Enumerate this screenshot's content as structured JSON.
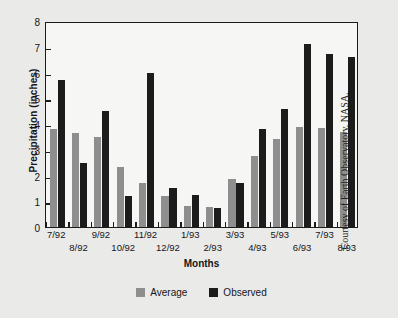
{
  "chart_data": {
    "type": "bar",
    "title": "",
    "xlabel": "Months",
    "ylabel": "Precipitation (inches)",
    "ylim": [
      0,
      8
    ],
    "yticks": [
      0,
      1,
      2,
      3,
      4,
      5,
      6,
      7,
      8
    ],
    "grid": false,
    "legend_position": "bottom-center",
    "categories": [
      "7/92",
      "8/92",
      "9/92",
      "10/92",
      "11/92",
      "12/92",
      "1/93",
      "2/93",
      "3/93",
      "4/93",
      "5/93",
      "6/93",
      "7/93",
      "8/93"
    ],
    "series": [
      {
        "name": "Average",
        "color": "#8e8e8e",
        "values": [
          3.8,
          3.65,
          3.5,
          2.35,
          1.7,
          1.2,
          0.8,
          0.78,
          1.85,
          2.75,
          3.4,
          3.9,
          3.85,
          3.7
        ]
      },
      {
        "name": "Observed",
        "color": "#1c1c1c",
        "values": [
          5.7,
          2.5,
          4.5,
          1.2,
          6.0,
          1.5,
          1.25,
          0.72,
          1.7,
          3.8,
          4.6,
          7.1,
          6.7,
          6.6
        ]
      }
    ]
  },
  "axes": {
    "y_title": "Precipitation (inches)",
    "x_title": "Months"
  },
  "legend": {
    "entries": [
      {
        "label": "Average",
        "color": "#8e8e8e"
      },
      {
        "label": "Observed",
        "color": "#1c1c1c"
      }
    ]
  },
  "credit": {
    "text": "Courtesy of Earth Observatory, NASA."
  },
  "colors": {
    "average_bar": "#8e8e8e",
    "observed_bar": "#1c1c1c",
    "plot_background": "#f6f6f4",
    "page_background": "#eaeae8",
    "axis_line": "#1b1b1b"
  }
}
